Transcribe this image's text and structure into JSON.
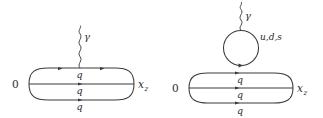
{
  "figure": {
    "type": "feynman-diagrams",
    "background_color": "#ffffff",
    "line_color": "#3a3a3a",
    "text_color": "#2b2b2b",
    "diagrams": [
      {
        "id": "left",
        "name": "direct-photon-emission-from-quark-line",
        "endpoint_left_label": "0",
        "endpoint_right_label": "x",
        "endpoint_right_subscript": "z",
        "photon_label": "γ",
        "quark_labels": [
          "q",
          "q",
          "q"
        ],
        "loop_label": "",
        "loop_present": "no"
      },
      {
        "id": "right",
        "name": "photon-quark-loop-above-baryon-line",
        "endpoint_left_label": "0",
        "endpoint_right_label": "x",
        "endpoint_right_subscript": "z",
        "photon_label": "γ",
        "quark_labels": [
          "q",
          "q",
          "q"
        ],
        "loop_label": "u,d,s",
        "loop_present": "yes"
      }
    ]
  }
}
